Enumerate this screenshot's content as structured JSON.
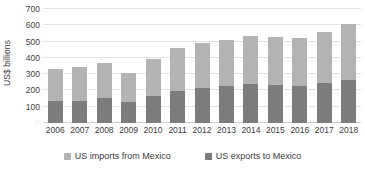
{
  "chart_data": {
    "type": "bar",
    "subtype": "stacked-bar",
    "title": "",
    "xlabel": "",
    "ylabel": "US$ billions",
    "ylim": [
      0,
      700
    ],
    "ytick_step": 100,
    "yticks": [
      0,
      100,
      200,
      300,
      400,
      500,
      600,
      700
    ],
    "ytick_labels": [
      "0",
      "100",
      "200",
      "300",
      "400",
      "500",
      "600",
      "700"
    ],
    "grid": true,
    "grid_axis": "y",
    "legend_position": "bottom",
    "categories": [
      "2006",
      "2007",
      "2008",
      "2009",
      "2010",
      "2011",
      "2012",
      "2013",
      "2014",
      "2015",
      "2016",
      "2017",
      "2018"
    ],
    "series": [
      {
        "name": "US exports to Mexico",
        "color": "#7c7c7c",
        "stack_order": 0,
        "values": [
          134,
          136,
          151,
          129,
          163,
          197,
          216,
          226,
          240,
          236,
          230,
          243,
          265
        ]
      },
      {
        "name": "US imports from Mexico",
        "color": "#b3b3b3",
        "stack_order": 1,
        "values": [
          198,
          211,
          216,
          176,
          230,
          264,
          278,
          281,
          294,
          295,
          295,
          314,
          346
        ]
      }
    ],
    "totals": [
      332,
      347,
      367,
      305,
      393,
      461,
      494,
      507,
      534,
      531,
      525,
      557,
      611
    ]
  },
  "axes": {
    "y_title": "US$ billions",
    "y_ticks": [
      {
        "label": "700",
        "value": 700
      },
      {
        "label": "600",
        "value": 600
      },
      {
        "label": "500",
        "value": 500
      },
      {
        "label": "400",
        "value": 400
      },
      {
        "label": "300",
        "value": 300
      },
      {
        "label": "200",
        "value": 200
      },
      {
        "label": "100",
        "value": 100
      },
      {
        "label": "0",
        "value": 0
      }
    ],
    "x_ticks": [
      "2006",
      "2007",
      "2008",
      "2009",
      "2010",
      "2011",
      "2012",
      "2013",
      "2014",
      "2015",
      "2016",
      "2017",
      "2018"
    ]
  },
  "legend": {
    "items": [
      {
        "label": "US imports from Mexico",
        "color": "#b3b3b3"
      },
      {
        "label": "US exports to Mexico",
        "color": "#7c7c7c"
      }
    ]
  },
  "colors": {
    "imports": "#b3b3b3",
    "exports": "#7c7c7c",
    "gridline": "#e2e2e2",
    "baseline": "#cfcfcf",
    "text": "#3b3b3b",
    "background": "#ffffff"
  }
}
